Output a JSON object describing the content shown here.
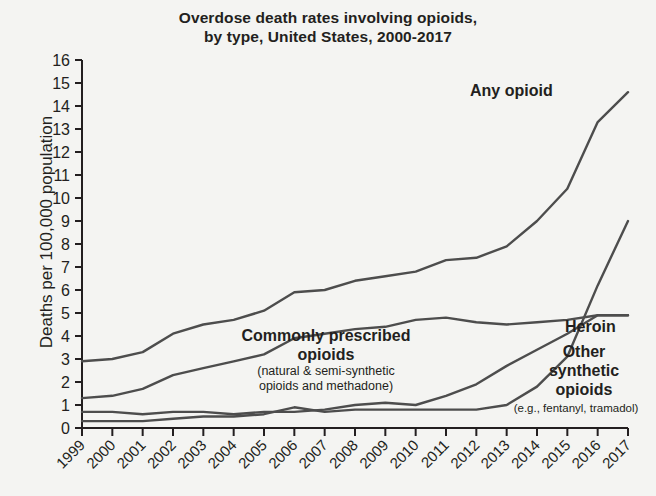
{
  "chart_data": {
    "type": "line",
    "title_line1": "Overdose death rates involving opioids,",
    "title_line2": "by type, United States, 2000-2017",
    "title": "Overdose death rates involving opioids, by type, United States, 2000-2017",
    "xlabel": "",
    "ylabel": "Deaths per 100,000 population",
    "xlim": [
      1999,
      2017
    ],
    "ylim": [
      0,
      16
    ],
    "grid": false,
    "legend_position": "inline-annotations",
    "ytick_labels": [
      "0",
      "1",
      "2",
      "3",
      "4",
      "5",
      "6",
      "7",
      "8",
      "9",
      "10",
      "11",
      "12",
      "13",
      "14",
      "15",
      "16"
    ],
    "ytick_values": [
      0,
      1,
      2,
      3,
      4,
      5,
      6,
      7,
      8,
      9,
      10,
      11,
      12,
      13,
      14,
      15,
      16
    ],
    "categories": [
      1999,
      2000,
      2001,
      2002,
      2003,
      2004,
      2005,
      2006,
      2007,
      2008,
      2009,
      2010,
      2011,
      2012,
      2013,
      2014,
      2015,
      2016,
      2017
    ],
    "xtick_labels": [
      "1999",
      "2000",
      "2001",
      "2002",
      "2003",
      "2004",
      "2005",
      "2006",
      "2007",
      "2008",
      "2009",
      "2010",
      "2011",
      "2012",
      "2013",
      "2014",
      "2015",
      "2016",
      "2017"
    ],
    "series": [
      {
        "name": "Any opioid",
        "label": "Any opioid",
        "color": "#4d4d4d",
        "values": [
          2.9,
          3.0,
          3.3,
          4.1,
          4.5,
          4.7,
          5.1,
          5.9,
          6.0,
          6.4,
          6.6,
          6.8,
          7.3,
          7.4,
          7.9,
          9.0,
          10.4,
          13.3,
          14.6
        ]
      },
      {
        "name": "Commonly prescribed opioids",
        "label": "Commonly prescribed opioids",
        "sublabel": "(natural & semi-synthetic opioids and methadone)",
        "sublabel_line1": "(natural & semi-synthetic",
        "sublabel_line2": "opioids and methadone)",
        "color": "#4d4d4d",
        "values": [
          1.3,
          1.4,
          1.7,
          2.3,
          2.6,
          2.9,
          3.2,
          3.9,
          4.1,
          4.3,
          4.4,
          4.7,
          4.8,
          4.6,
          4.5,
          4.6,
          4.7,
          4.9,
          4.9
        ]
      },
      {
        "name": "Heroin",
        "label": "Heroin",
        "color": "#4d4d4d",
        "values": [
          0.7,
          0.7,
          0.6,
          0.7,
          0.7,
          0.6,
          0.7,
          0.7,
          0.8,
          1.0,
          1.1,
          1.0,
          1.4,
          1.9,
          2.7,
          3.4,
          4.1,
          4.9,
          4.9
        ]
      },
      {
        "name": "Other synthetic opioids",
        "label": "Other synthetic opioids",
        "label_line1": "Other",
        "label_line2": "synthetic",
        "label_line3": "opioids",
        "sublabel": "(e.g., fentanyl, tramadol)",
        "color": "#4d4d4d",
        "values": [
          0.3,
          0.3,
          0.3,
          0.4,
          0.5,
          0.5,
          0.6,
          0.9,
          0.7,
          0.8,
          0.8,
          0.8,
          0.8,
          0.8,
          1.0,
          1.8,
          3.1,
          6.2,
          9.0
        ]
      }
    ]
  }
}
